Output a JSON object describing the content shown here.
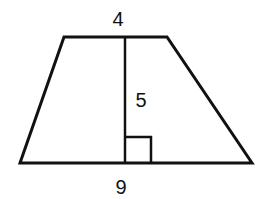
{
  "diagram": {
    "shape": "trapezoid",
    "labels": {
      "top_base": "4",
      "height": "5",
      "bottom_base": "9"
    },
    "right_angle_marker": true,
    "stroke_color": "#111111",
    "background": "#ffffff"
  }
}
